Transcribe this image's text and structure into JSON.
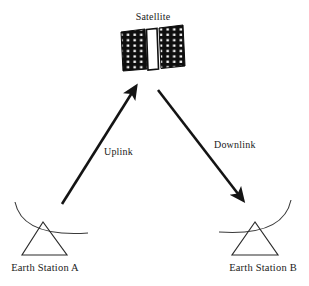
{
  "diagram": {
    "background_color": "#ffffff",
    "line_color": "#141414",
    "text_color": "#1a1a1a",
    "panel_color": "#0e0e0e",
    "panel_dot_color": "#ffffff",
    "body_color": "#ffffff"
  },
  "nodes": {
    "satellite": {
      "label": "Satellite",
      "label_x": 153,
      "label_y": 20,
      "x": 152,
      "y": 49,
      "panel_dot_rows": 8,
      "panel_dot_cols": 4
    },
    "station_a": {
      "label": "Earth Station A",
      "label_x": 44,
      "label_y": 271,
      "apex_x": 43,
      "apex_y": 222,
      "base_left_x": 22,
      "base_right_x": 67,
      "base_y": 255
    },
    "station_b": {
      "label": "Earth Station B",
      "label_x": 264,
      "label_y": 271,
      "apex_x": 255,
      "apex_y": 222,
      "base_left_x": 232,
      "base_right_x": 278,
      "base_y": 255
    }
  },
  "links": [
    {
      "id": "uplink",
      "label": "Uplink",
      "from": "station_a",
      "to": "satellite",
      "direction": "up-right",
      "label_x": 104,
      "label_y": 155,
      "start_x": 62,
      "start_y": 204,
      "end_x": 138,
      "end_y": 85
    },
    {
      "id": "downlink",
      "label": "Downlink",
      "from": "satellite",
      "to": "station_b",
      "direction": "down-right",
      "label_x": 214,
      "label_y": 148,
      "start_x": 158,
      "start_y": 90,
      "end_x": 245,
      "end_y": 203
    }
  ]
}
